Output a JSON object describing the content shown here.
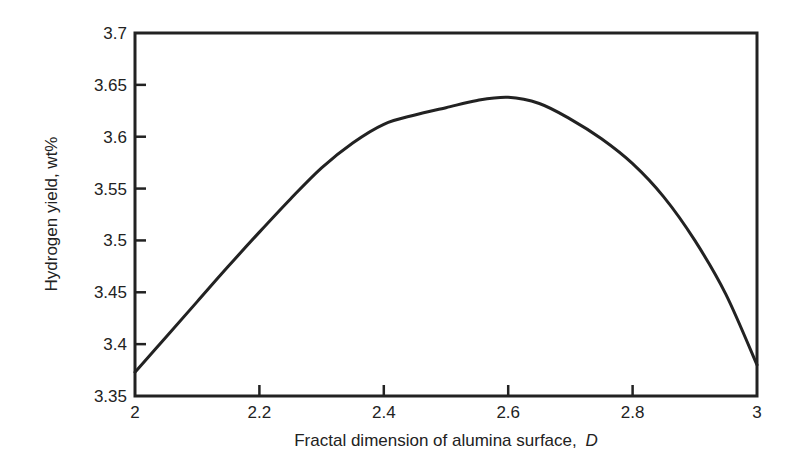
{
  "chart_data": {
    "type": "line",
    "title": "",
    "xlabel": "Fractal dimension of alumina surface,",
    "xlabel_italic_symbol": "D",
    "ylabel": "Hydrogen yield, wt%",
    "xlim": [
      2,
      3
    ],
    "ylim": [
      3.35,
      3.7
    ],
    "xticks": [
      2,
      2.2,
      2.4,
      2.6,
      2.8,
      3
    ],
    "xtick_labels": [
      "2",
      "2.2",
      "2.4",
      "2.6",
      "2.8",
      "3"
    ],
    "yticks": [
      3.35,
      3.4,
      3.45,
      3.5,
      3.55,
      3.6,
      3.65,
      3.7
    ],
    "ytick_labels": [
      "3.35",
      "3.4",
      "3.45",
      "3.5",
      "3.55",
      "3.6",
      "3.65",
      "3.7"
    ],
    "grid": false,
    "legend": null,
    "series": [
      {
        "name": "Hydrogen yield",
        "color": "#222222",
        "x": [
          2.0,
          2.05,
          2.1,
          2.15,
          2.2,
          2.25,
          2.3,
          2.35,
          2.4,
          2.45,
          2.5,
          2.55,
          2.6,
          2.65,
          2.7,
          2.75,
          2.8,
          2.85,
          2.9,
          2.95,
          3.0
        ],
        "y": [
          3.373,
          3.407,
          3.441,
          3.475,
          3.508,
          3.54,
          3.57,
          3.594,
          3.612,
          3.621,
          3.628,
          3.635,
          3.638,
          3.632,
          3.617,
          3.598,
          3.574,
          3.542,
          3.5,
          3.448,
          3.38
        ]
      }
    ]
  }
}
